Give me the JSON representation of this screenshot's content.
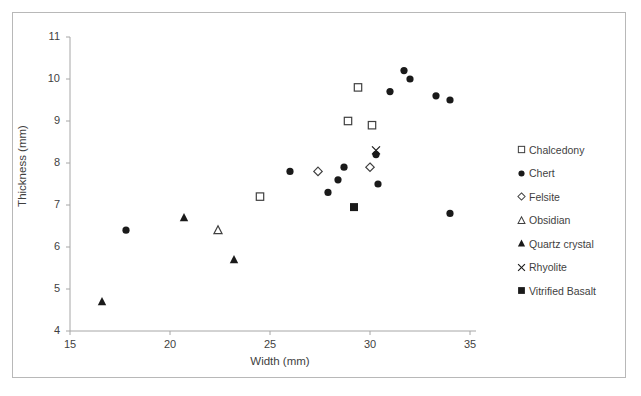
{
  "chart_data": {
    "type": "scatter",
    "title": "",
    "xlabel": "Width (mm)",
    "ylabel": "Thickness (mm)",
    "xlim": [
      15,
      35
    ],
    "ylim": [
      4,
      11
    ],
    "xticks": [
      "15",
      "20",
      "25",
      "30",
      "35"
    ],
    "yticks": [
      "11",
      "10",
      "9",
      "8",
      "7",
      "6",
      "5",
      "4"
    ],
    "grid": false,
    "legend_position": "right",
    "series": [
      {
        "name": "Chalcedony",
        "marker": "open-square",
        "color": "#404040",
        "points": [
          {
            "x": 24.5,
            "y": 7.2
          },
          {
            "x": 28.9,
            "y": 9.0
          },
          {
            "x": 29.4,
            "y": 9.8
          },
          {
            "x": 30.1,
            "y": 8.9
          }
        ]
      },
      {
        "name": "Chert",
        "marker": "filled-circle",
        "color": "#1a1a1a",
        "points": [
          {
            "x": 17.8,
            "y": 6.4
          },
          {
            "x": 26.0,
            "y": 7.8
          },
          {
            "x": 27.9,
            "y": 7.3
          },
          {
            "x": 28.4,
            "y": 7.6
          },
          {
            "x": 28.7,
            "y": 7.9
          },
          {
            "x": 30.3,
            "y": 8.2
          },
          {
            "x": 30.4,
            "y": 7.5
          },
          {
            "x": 31.0,
            "y": 9.7
          },
          {
            "x": 31.7,
            "y": 10.2
          },
          {
            "x": 32.0,
            "y": 10.0
          },
          {
            "x": 33.3,
            "y": 9.6
          },
          {
            "x": 34.0,
            "y": 9.5
          },
          {
            "x": 34.0,
            "y": 6.8
          }
        ]
      },
      {
        "name": "Felsite",
        "marker": "open-diamond",
        "color": "#404040",
        "points": [
          {
            "x": 27.4,
            "y": 7.8
          },
          {
            "x": 30.0,
            "y": 7.9
          }
        ]
      },
      {
        "name": "Obsidian",
        "marker": "open-triangle",
        "color": "#404040",
        "points": [
          {
            "x": 22.4,
            "y": 6.4
          }
        ]
      },
      {
        "name": "Quartz crystal",
        "marker": "filled-triangle",
        "color": "#1a1a1a",
        "points": [
          {
            "x": 16.6,
            "y": 4.7
          },
          {
            "x": 20.7,
            "y": 6.7
          },
          {
            "x": 23.2,
            "y": 5.7
          }
        ]
      },
      {
        "name": "Rhyolite",
        "marker": "cross-x",
        "color": "#1a1a1a",
        "points": [
          {
            "x": 30.3,
            "y": 8.3
          }
        ]
      },
      {
        "name": "Vitrified Basalt",
        "marker": "filled-square",
        "color": "#1a1a1a",
        "points": [
          {
            "x": 29.2,
            "y": 6.95
          }
        ]
      }
    ]
  },
  "axes": {
    "x_label": "Width (mm)",
    "y_label": "Thickness (mm)",
    "x_ticks": [
      "15",
      "20",
      "25",
      "30",
      "35"
    ],
    "y_ticks": [
      "11",
      "10",
      "9",
      "8",
      "7",
      "6",
      "5",
      "4"
    ]
  },
  "legend": {
    "items": [
      {
        "label": "Chalcedony",
        "marker": "open-square"
      },
      {
        "label": "Chert",
        "marker": "filled-circle"
      },
      {
        "label": "Felsite",
        "marker": "open-diamond"
      },
      {
        "label": "Obsidian",
        "marker": "open-triangle"
      },
      {
        "label": "Quartz crystal",
        "marker": "filled-triangle"
      },
      {
        "label": "Rhyolite",
        "marker": "cross-x"
      },
      {
        "label": "Vitrified Basalt",
        "marker": "filled-square"
      }
    ]
  },
  "colors": {
    "axis": "#a6a6a6",
    "text": "#3f3f3f",
    "marker_fill": "#1a1a1a",
    "marker_open": "#404040",
    "border": "#b8b8b8",
    "background": "#ffffff"
  }
}
